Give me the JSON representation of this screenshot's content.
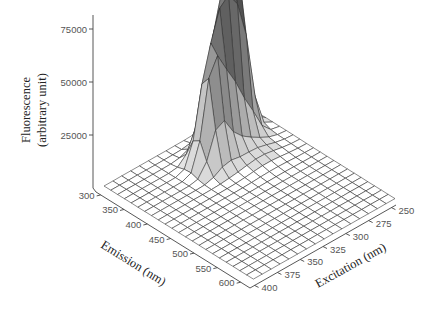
{
  "chart_data": {
    "type": "surface3d",
    "title": "",
    "zlabel": "Fluorescence (arbitrary unit)",
    "zlabel_lines": [
      "Fluorescence",
      "(arbitrary unit)"
    ],
    "xlabel": "Emission (nm)",
    "ylabel": "Excitation (nm)",
    "z_ticks": [
      "25000",
      "50000",
      "75000"
    ],
    "z_range": [
      0,
      80000
    ],
    "emission_ticks": [
      "300",
      "350",
      "400",
      "450",
      "500",
      "550",
      "600"
    ],
    "emission_range": [
      290,
      620
    ],
    "excitation_ticks": [
      "250",
      "275",
      "300",
      "325",
      "350",
      "375",
      "400"
    ],
    "excitation_range": [
      245,
      405
    ],
    "emission_grid_nm": [
      290,
      305,
      320,
      335,
      350,
      365,
      380,
      395,
      410,
      425,
      440,
      455,
      470,
      485,
      500,
      515,
      530,
      545,
      560,
      575,
      590,
      605,
      620
    ],
    "excitation_grid_nm": [
      245,
      255,
      265,
      275,
      285,
      295,
      305,
      315,
      325,
      335,
      345,
      355,
      365,
      375,
      385,
      395,
      405
    ],
    "peaks": [
      {
        "emission_nm": 335,
        "excitation_nm": 280,
        "fluorescence": 80000,
        "label": "main peak"
      },
      {
        "emission_nm": 345,
        "excitation_nm": 300,
        "fluorescence": 62000,
        "label": "secondary ridge"
      },
      {
        "emission_nm": 360,
        "excitation_nm": 320,
        "fluorescence": 48000,
        "label": "ridge shoulder"
      }
    ],
    "grid": true,
    "legend": "none"
  }
}
